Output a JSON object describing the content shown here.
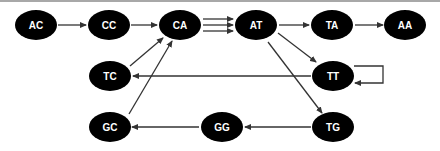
{
  "diagram": {
    "type": "directed-graph",
    "colors": {
      "node_fill": "#000000",
      "node_text": "#ffffff",
      "edge": "#333333",
      "background": "#ffffff"
    },
    "nodes": [
      {
        "id": "AC",
        "label": "AC",
        "x": 36,
        "y": 25
      },
      {
        "id": "CC",
        "label": "CC",
        "x": 109,
        "y": 25
      },
      {
        "id": "CA",
        "label": "CA",
        "x": 180,
        "y": 25
      },
      {
        "id": "AT",
        "label": "AT",
        "x": 256,
        "y": 25
      },
      {
        "id": "TA",
        "label": "TA",
        "x": 332,
        "y": 25
      },
      {
        "id": "AA",
        "label": "AA",
        "x": 405,
        "y": 25
      },
      {
        "id": "TC",
        "label": "TC",
        "x": 110,
        "y": 75
      },
      {
        "id": "TT",
        "label": "TT",
        "x": 333,
        "y": 75
      },
      {
        "id": "GC",
        "label": "GC",
        "x": 110,
        "y": 127
      },
      {
        "id": "GG",
        "label": "GG",
        "x": 222,
        "y": 127
      },
      {
        "id": "TG",
        "label": "TG",
        "x": 333,
        "y": 127
      }
    ],
    "edges": [
      {
        "from": "AC",
        "to": "CC"
      },
      {
        "from": "CC",
        "to": "CA"
      },
      {
        "from": "CA",
        "to": "AT"
      },
      {
        "from": "CA",
        "to": "AT"
      },
      {
        "from": "CA",
        "to": "AT"
      },
      {
        "from": "AT",
        "to": "TA"
      },
      {
        "from": "TA",
        "to": "AA"
      },
      {
        "from": "AT",
        "to": "TT"
      },
      {
        "from": "AT",
        "to": "TG"
      },
      {
        "from": "TT",
        "to": "TC"
      },
      {
        "from": "TT",
        "to": "TT"
      },
      {
        "from": "TC",
        "to": "CA"
      },
      {
        "from": "GC",
        "to": "CA"
      },
      {
        "from": "TG",
        "to": "GG"
      },
      {
        "from": "GG",
        "to": "GC"
      }
    ]
  }
}
